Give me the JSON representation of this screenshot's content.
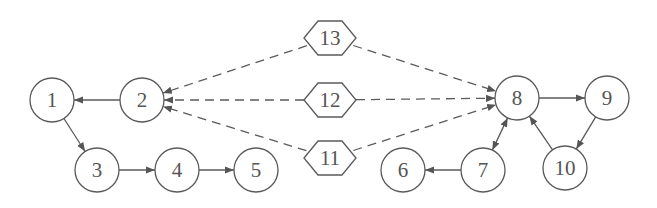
{
  "diagram": {
    "type": "directed-graph",
    "colors": {
      "stroke": "#5a5a5a",
      "text": "#555555",
      "arrow": "#555555",
      "background": "#ffffff"
    },
    "nodes": [
      {
        "id": "1",
        "label": "1",
        "shape": "circle",
        "x": 52,
        "y": 100
      },
      {
        "id": "2",
        "label": "2",
        "shape": "circle",
        "x": 142,
        "y": 100
      },
      {
        "id": "3",
        "label": "3",
        "shape": "circle",
        "x": 97,
        "y": 170
      },
      {
        "id": "4",
        "label": "4",
        "shape": "circle",
        "x": 177,
        "y": 170
      },
      {
        "id": "5",
        "label": "5",
        "shape": "circle",
        "x": 256,
        "y": 170
      },
      {
        "id": "6",
        "label": "6",
        "shape": "circle",
        "x": 403,
        "y": 170
      },
      {
        "id": "7",
        "label": "7",
        "shape": "circle",
        "x": 483,
        "y": 170
      },
      {
        "id": "8",
        "label": "8",
        "shape": "circle",
        "x": 517,
        "y": 98
      },
      {
        "id": "9",
        "label": "9",
        "shape": "circle",
        "x": 607,
        "y": 98
      },
      {
        "id": "10",
        "label": "10",
        "shape": "circle",
        "x": 565,
        "y": 168
      },
      {
        "id": "11",
        "label": "11",
        "shape": "hexagon",
        "x": 330,
        "y": 158
      },
      {
        "id": "12",
        "label": "12",
        "shape": "hexagon",
        "x": 330,
        "y": 100
      },
      {
        "id": "13",
        "label": "13",
        "shape": "hexagon",
        "x": 330,
        "y": 38
      }
    ],
    "edges": [
      {
        "from": "2",
        "to": "1",
        "style": "solid"
      },
      {
        "from": "1",
        "to": "3",
        "style": "solid"
      },
      {
        "from": "3",
        "to": "4",
        "style": "solid"
      },
      {
        "from": "4",
        "to": "5",
        "style": "solid"
      },
      {
        "from": "13",
        "to": "2",
        "style": "dashed"
      },
      {
        "from": "12",
        "to": "2",
        "style": "dashed"
      },
      {
        "from": "11",
        "to": "2",
        "style": "dashed"
      },
      {
        "from": "13",
        "to": "8",
        "style": "dashed"
      },
      {
        "from": "12",
        "to": "8",
        "style": "dashed"
      },
      {
        "from": "11",
        "to": "8",
        "style": "dashed"
      },
      {
        "from": "8",
        "to": "9",
        "style": "solid"
      },
      {
        "from": "9",
        "to": "10",
        "style": "solid"
      },
      {
        "from": "10",
        "to": "8",
        "style": "solid"
      },
      {
        "from": "7",
        "to": "8",
        "style": "solid",
        "bidirectional": true
      },
      {
        "from": "7",
        "to": "6",
        "style": "solid"
      }
    ]
  }
}
